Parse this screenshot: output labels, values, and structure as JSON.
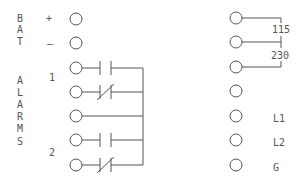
{
  "diagram": {
    "type": "terminal wiring diagram",
    "left_block": {
      "group_labels": {
        "battery": [
          "B",
          "A",
          "T"
        ],
        "alarms": [
          "A",
          "L",
          "A",
          "R",
          "M",
          "S"
        ]
      },
      "polarity": {
        "plus": "+",
        "minus": "–"
      },
      "alarm_numbers": [
        "1",
        "2"
      ],
      "terminals": [
        {
          "y": 19,
          "role": "BAT +"
        },
        {
          "y": 43,
          "role": "BAT -"
        },
        {
          "y": 68,
          "role": "Alarm 1 NO"
        },
        {
          "y": 92,
          "role": "Alarm 1 NC"
        },
        {
          "y": 116,
          "role": "Common"
        },
        {
          "y": 140,
          "role": "Alarm 2 NO"
        },
        {
          "y": 165,
          "role": "Alarm 2 NC"
        }
      ]
    },
    "right_block": {
      "voltage_labels": [
        "115",
        "230"
      ],
      "line_labels": [
        "L1",
        "L2",
        "G"
      ],
      "terminals": [
        {
          "y": 18
        },
        {
          "y": 42
        },
        {
          "y": 67
        },
        {
          "y": 91
        },
        {
          "y": 116
        },
        {
          "y": 140
        },
        {
          "y": 165
        }
      ]
    },
    "colors": {
      "ink": "#555555",
      "background": "#ffffff"
    }
  }
}
